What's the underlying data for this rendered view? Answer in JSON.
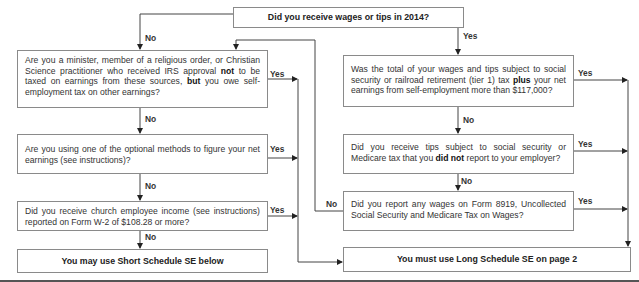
{
  "flowchart": {
    "start": {
      "text": "Did you receive wages or tips in 2014?"
    },
    "left_branch": {
      "q1": {
        "parts": [
          "Are you a minister, member of a religious order, or Christian Science practitioner who received IRS approval ",
          "not",
          " to be taxed on earnings from these sources, ",
          "but",
          " you owe self-employment tax on other earnings?"
        ]
      },
      "q2": {
        "text": "Are you using one of the optional methods to figure your net earnings (see instructions)?"
      },
      "q3": {
        "text": "Did you receive church employee income (see instructions) reported on Form  W-2 of $108.28 or more?"
      },
      "result": {
        "text": "You may use Short Schedule SE below"
      }
    },
    "right_branch": {
      "q1": {
        "parts": [
          "Was the total of your wages and tips subject to social security or railroad retirement (tier 1) tax ",
          "plus",
          " your net earnings from self-employment more than $117,000?"
        ]
      },
      "q2": {
        "parts": [
          "Did you receive tips subject to social security or Medicare tax that you ",
          "did not",
          " report to your employer?"
        ]
      },
      "q3": {
        "text": "Did you report any wages on Form 8919, Uncollected Social Security and Medicare Tax on Wages?"
      },
      "result": {
        "text": "You must use Long Schedule SE on page 2"
      }
    },
    "labels": {
      "yes": "Yes",
      "no": "No"
    },
    "colors": {
      "line": "#444444",
      "border": "#8a8a8a",
      "text": "#333333"
    }
  }
}
